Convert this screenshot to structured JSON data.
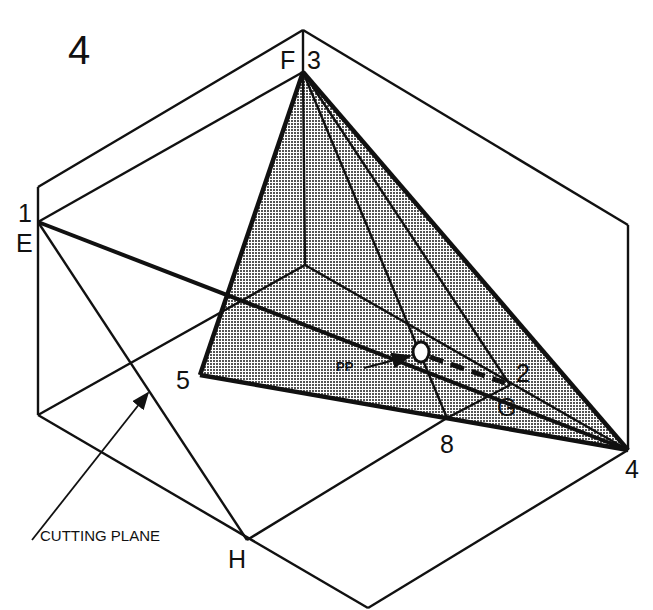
{
  "figure": {
    "number": "4",
    "ink_color": "#111111",
    "shade_color": "#9a9a9a",
    "background": "#ffffff"
  },
  "labels": {
    "F": "F",
    "three": "3",
    "one": "1",
    "E": "E",
    "five": "5",
    "pp": "PP",
    "two": "2",
    "G": "G",
    "eight": "8",
    "four": "4",
    "H": "H",
    "cutting_plane": "CUTTING PLANE"
  },
  "points": {
    "F3": [
      303,
      72
    ],
    "E1": [
      38,
      222
    ],
    "P5": [
      200,
      375
    ],
    "P2": [
      510,
      385
    ],
    "P8": [
      447,
      418
    ],
    "P4": [
      628,
      450
    ],
    "H": [
      247,
      540
    ],
    "PP": [
      420,
      352
    ],
    "inner_corner": [
      305,
      265
    ]
  }
}
